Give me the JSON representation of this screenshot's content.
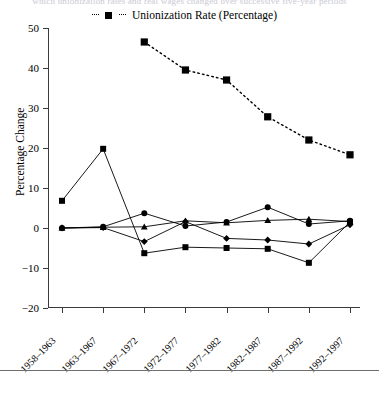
{
  "caption_sliver": "which unionization rates and real wages changed over successive five-year periods",
  "legend": {
    "entries": [
      {
        "label": "Unionization Rate (Percentage)",
        "marker": "square",
        "line": "dotted",
        "color": "#000000"
      }
    ]
  },
  "axes": {
    "ylabel": "Percentage Change",
    "yticks": [
      50,
      40,
      30,
      20,
      10,
      0,
      -10,
      -20
    ],
    "ylim": [
      -20,
      50
    ],
    "xlabel": ""
  },
  "chart_data": {
    "type": "line",
    "title": "",
    "subtitle": "",
    "xlabel": "",
    "ylabel": "Percentage Change",
    "ylim": [
      -20,
      50
    ],
    "yticks": [
      -20,
      -10,
      0,
      10,
      20,
      30,
      40,
      50
    ],
    "grid": false,
    "legend_position": "top-center",
    "categories": [
      "1958–1963",
      "1963–1967",
      "1967–1972",
      "1972–1977",
      "1977–1982",
      "1982–1987",
      "1987–1992",
      "1992–1997"
    ],
    "series": [
      {
        "name": "Unionization Rate (Percentage)",
        "marker": "square",
        "linestyle": "dotted",
        "color": "#000000",
        "values": [
          null,
          null,
          46.5,
          39.5,
          37.0,
          27.8,
          22.0,
          18.3
        ]
      },
      {
        "name": "series-square",
        "marker": "square",
        "linestyle": "solid",
        "color": "#000000",
        "values": [
          6.8,
          19.8,
          -6.3,
          -4.8,
          -5.0,
          -5.2,
          -8.7,
          1.5
        ]
      },
      {
        "name": "series-circle",
        "marker": "circle",
        "linestyle": "solid",
        "color": "#000000",
        "values": [
          0.0,
          0.3,
          3.7,
          0.5,
          1.5,
          5.2,
          1.0,
          1.8
        ]
      },
      {
        "name": "series-triangle",
        "marker": "triangle",
        "linestyle": "solid",
        "color": "#000000",
        "values": [
          0.0,
          0.2,
          0.3,
          1.8,
          1.3,
          1.9,
          2.2,
          1.6
        ]
      },
      {
        "name": "series-diamond",
        "marker": "diamond",
        "linestyle": "solid",
        "color": "#000000",
        "values": [
          0.0,
          0.1,
          -3.4,
          1.6,
          -2.6,
          -3.0,
          -4.0,
          0.8
        ]
      }
    ]
  }
}
